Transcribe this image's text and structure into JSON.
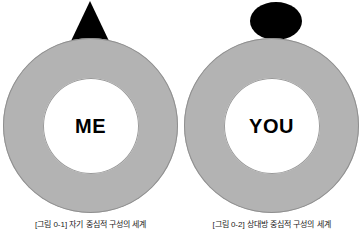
{
  "figure": {
    "panels": [
      {
        "id": "left",
        "head_shape": "triangle-head-shape",
        "ring_label": "ME",
        "caption": "[그림 0-1] 자기 중심적 구성의 세계"
      },
      {
        "id": "right",
        "head_shape": "ellipse-head-shape",
        "ring_label": "YOU",
        "caption": "[그림 0-2] 상대방 중심적 구성의 세계"
      }
    ],
    "colors": {
      "ring_fill": "#b3b3b3",
      "ring_outline": "#8f8f8f",
      "hole_fill": "#ffffff",
      "head_fill": "#000000",
      "label_text": "#000000",
      "background": "#ffffff"
    }
  }
}
